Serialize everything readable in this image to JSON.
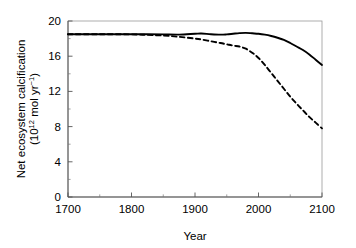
{
  "chart_data": {
    "type": "line",
    "title": "",
    "xlabel": "Year",
    "ylabel_line1": "Net ecosystem calcification",
    "ylabel_line2_pre": "(10",
    "ylabel_line2_exp1": "12",
    "ylabel_line2_mid": " mol yr",
    "ylabel_line2_exp2": "−1",
    "ylabel_line2_post": ")",
    "ylabel_plain": "Net ecosystem calcification (10^12 mol yr^-1)",
    "xlim": [
      1700,
      2100
    ],
    "ylim": [
      0,
      20
    ],
    "xticks": [
      1700,
      1800,
      1900,
      2000,
      2100
    ],
    "yticks": [
      0,
      4,
      8,
      12,
      16,
      20
    ],
    "xtick_labels": [
      "1700",
      "1800",
      "1900",
      "2000",
      "2100"
    ],
    "ytick_labels": [
      "0",
      "4",
      "8",
      "12",
      "16",
      "20"
    ],
    "grid": false,
    "legend": "none",
    "minor_xticks": [
      1750,
      1850,
      1950,
      2050
    ],
    "minor_yticks": [
      2,
      6,
      10,
      14,
      18
    ],
    "series": [
      {
        "name": "solid",
        "style": "solid",
        "color": "#000000",
        "x": [
          1700,
          1750,
          1800,
          1825,
          1850,
          1875,
          1900,
          1910,
          1925,
          1940,
          1950,
          1960,
          1970,
          1980,
          1990,
          2000,
          2010,
          2020,
          2030,
          2040,
          2050,
          2060,
          2070,
          2080,
          2090,
          2100
        ],
        "values": [
          18.5,
          18.5,
          18.5,
          18.5,
          18.48,
          18.45,
          18.55,
          18.58,
          18.5,
          18.45,
          18.48,
          18.55,
          18.62,
          18.65,
          18.6,
          18.55,
          18.45,
          18.3,
          18.1,
          17.85,
          17.5,
          17.1,
          16.7,
          16.2,
          15.6,
          15.0
        ]
      },
      {
        "name": "dashed",
        "style": "dashed",
        "color": "#000000",
        "x": [
          1700,
          1750,
          1800,
          1825,
          1850,
          1875,
          1900,
          1910,
          1925,
          1940,
          1950,
          1960,
          1970,
          1980,
          1990,
          2000,
          2010,
          2020,
          2030,
          2040,
          2050,
          2060,
          2070,
          2080,
          2090,
          2100
        ],
        "values": [
          18.5,
          18.5,
          18.48,
          18.42,
          18.35,
          18.2,
          18.0,
          17.9,
          17.7,
          17.5,
          17.35,
          17.2,
          17.1,
          16.85,
          16.4,
          15.8,
          15.0,
          14.1,
          13.2,
          12.3,
          11.4,
          10.6,
          9.85,
          9.1,
          8.45,
          7.8
        ]
      }
    ]
  },
  "axes_geometry": {
    "left": 68,
    "right": 322,
    "top": 21,
    "bottom": 197
  }
}
